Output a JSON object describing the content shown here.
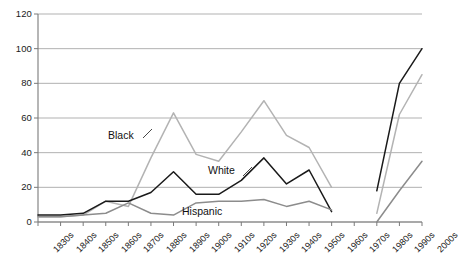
{
  "chart_data": {
    "type": "line",
    "title": "",
    "subtitle": "",
    "xlabel": "",
    "ylabel": "",
    "ylim": [
      0,
      120
    ],
    "ytick_values": [
      0,
      20,
      40,
      60,
      80,
      100,
      120
    ],
    "ytick_labels": [
      "0",
      "20",
      "40",
      "60",
      "80",
      "100",
      "120"
    ],
    "grid": "horizontal",
    "legend_position": "inline-annotations",
    "categories": [
      "1830s",
      "1840s",
      "1850s",
      "1860s",
      "1870s",
      "1880s",
      "1890s",
      "1900s",
      "1910s",
      "1920s",
      "1930s",
      "1940s",
      "1950s",
      "1960s",
      "1970s",
      "1980s",
      "1990s",
      "2000s"
    ],
    "series": [
      {
        "name": "Black",
        "color": "#b3b3b3",
        "values": [
          3,
          3,
          4,
          12,
          9,
          37,
          63,
          39,
          35,
          52,
          70,
          50,
          43,
          20,
          null,
          5,
          62,
          85
        ]
      },
      {
        "name": "White",
        "color": "#1a1a1a",
        "values": [
          4,
          4,
          5,
          12,
          12,
          17,
          29,
          16,
          16,
          24,
          37,
          22,
          30,
          6,
          null,
          18,
          80,
          100
        ]
      },
      {
        "name": "Hispanic",
        "color": "#8c8c8c",
        "values": [
          3,
          3,
          4,
          5,
          11,
          5,
          4,
          11,
          12,
          12,
          13,
          9,
          12,
          7,
          null,
          0,
          18,
          35
        ]
      }
    ],
    "annotations": [
      {
        "text": "Black",
        "series": "Black",
        "leader": true
      },
      {
        "text": "White",
        "series": "White",
        "leader": true
      },
      {
        "text": "Hispanic",
        "series": "Hispanic",
        "leader": false
      }
    ]
  },
  "axes": {
    "y_axis_name": "value-axis",
    "x_axis_name": "decade-axis"
  }
}
